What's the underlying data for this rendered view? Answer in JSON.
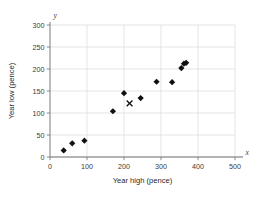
{
  "chart_data": {
    "type": "scatter",
    "title": "",
    "xlabel": "Year high (pence)",
    "ylabel": "Year low (pence)",
    "x_axis_name": "x",
    "y_axis_name": "y",
    "xlim": [
      0,
      500
    ],
    "ylim": [
      0,
      300
    ],
    "xticks": [
      0,
      100,
      200,
      300,
      400,
      500
    ],
    "yticks": [
      0,
      50,
      100,
      150,
      200,
      250,
      300
    ],
    "xtick_labels": [
      "0",
      "100",
      "200",
      "300",
      "400",
      "500"
    ],
    "ytick_labels": [
      "0",
      "50",
      "100",
      "150",
      "200",
      "250",
      "300"
    ],
    "grid": true,
    "legend": "none",
    "series": [
      {
        "name": "data-points",
        "marker": "diamond",
        "color": "#101010",
        "points": [
          {
            "x": 37,
            "y": 15
          },
          {
            "x": 60,
            "y": 31
          },
          {
            "x": 93,
            "y": 37
          },
          {
            "x": 170,
            "y": 104
          },
          {
            "x": 200,
            "y": 145
          },
          {
            "x": 245,
            "y": 134
          },
          {
            "x": 288,
            "y": 171
          },
          {
            "x": 330,
            "y": 170
          },
          {
            "x": 355,
            "y": 202
          },
          {
            "x": 362,
            "y": 212
          },
          {
            "x": 368,
            "y": 214
          }
        ]
      },
      {
        "name": "mean-point",
        "marker": "cross",
        "color": "#101010",
        "points": [
          {
            "x": 215,
            "y": 122
          }
        ]
      }
    ]
  }
}
